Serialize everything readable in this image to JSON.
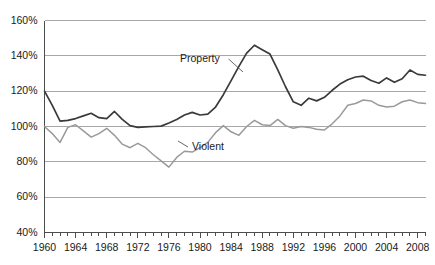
{
  "chart_data": {
    "type": "line",
    "title": "",
    "subtitle": "",
    "xlabel": "",
    "ylabel": "",
    "grid": "horizontal",
    "legend_position": "inline-annotation",
    "xlim": [
      1960,
      2009
    ],
    "ylim": [
      40,
      160
    ],
    "y_tick_labels": [
      "160%",
      "140%",
      "120%",
      "100%",
      "80%",
      "60%",
      "40%"
    ],
    "y_tick_values": [
      160,
      140,
      120,
      100,
      80,
      60,
      40
    ],
    "x_tick_labels": [
      "1960",
      "1964",
      "1968",
      "1972",
      "1976",
      "1980",
      "1984",
      "1988",
      "1992",
      "1996",
      "2000",
      "2004",
      "2008"
    ],
    "x_tick_values": [
      1960,
      1964,
      1968,
      1972,
      1976,
      1980,
      1984,
      1988,
      1992,
      1996,
      2000,
      2004,
      2008
    ],
    "x_minor_tick_step": 1,
    "x": [
      1960,
      1961,
      1962,
      1963,
      1964,
      1965,
      1966,
      1967,
      1968,
      1969,
      1970,
      1971,
      1972,
      1973,
      1974,
      1975,
      1976,
      1977,
      1978,
      1979,
      1980,
      1981,
      1982,
      1983,
      1984,
      1985,
      1986,
      1987,
      1988,
      1989,
      1990,
      1991,
      1992,
      1993,
      1994,
      1995,
      1996,
      1997,
      1998,
      1999,
      2000,
      2001,
      2002,
      2003,
      2004,
      2005,
      2006,
      2007,
      2008,
      2009
    ],
    "series": [
      {
        "name": "Property",
        "color": "#3a3a3a",
        "width": 1.7,
        "label_text": "Property",
        "values": [
          120.0,
          112.0,
          103.0,
          103.5,
          104.5,
          106.0,
          107.5,
          105.0,
          104.5,
          108.5,
          104.0,
          100.5,
          99.5,
          99.8,
          100.0,
          100.2,
          102.0,
          104.0,
          106.5,
          108.0,
          106.5,
          107.0,
          111.0,
          118.0,
          126.0,
          134.0,
          141.5,
          146.0,
          143.5,
          141.0,
          132.0,
          122.5,
          114.0,
          112.0,
          116.0,
          114.5,
          116.5,
          120.5,
          124.0,
          126.5,
          128.0,
          128.5,
          126.0,
          124.5,
          127.5,
          125.0,
          127.0,
          132.0,
          129.5,
          129.0
        ]
      },
      {
        "name": "Violent",
        "color": "#9a9a9a",
        "width": 1.5,
        "label_text": "Violent",
        "values": [
          100.0,
          96.0,
          91.0,
          99.5,
          101.0,
          97.5,
          94.0,
          96.0,
          99.0,
          95.0,
          90.0,
          88.0,
          90.5,
          88.0,
          84.0,
          80.5,
          77.0,
          82.5,
          86.0,
          85.5,
          88.0,
          91.0,
          96.5,
          100.5,
          97.0,
          95.0,
          100.0,
          103.5,
          101.0,
          100.5,
          104.0,
          100.5,
          99.0,
          100.0,
          99.5,
          98.5,
          98.0,
          101.5,
          106.0,
          112.0,
          113.0,
          115.0,
          114.5,
          112.0,
          111.0,
          111.5,
          114.0,
          115.0,
          113.5,
          113.0
        ]
      }
    ],
    "annotations": [
      {
        "name": "property-label",
        "text": "Property",
        "x_px": 180,
        "y_px": 62,
        "leader_to_x_px": 243,
        "leader_to_y_px": 72
      },
      {
        "name": "violent-label",
        "text": "Violent",
        "x_px": 192,
        "y_px": 150,
        "leader_to_x_px": 178,
        "leader_to_y_px": 141
      }
    ]
  },
  "axis": {
    "y_labels": [
      "160%",
      "140%",
      "120%",
      "100%",
      "80%",
      "60%",
      "40%"
    ],
    "x_labels": [
      "1960",
      "1964",
      "1968",
      "1972",
      "1976",
      "1980",
      "1984",
      "1988",
      "1992",
      "1996",
      "2000",
      "2004",
      "2008"
    ]
  },
  "colors": {
    "property_line": "#3a3a3a",
    "violent_line": "#9a9a9a",
    "gridline": "#a8a8a8",
    "axis": "#4d4d4d",
    "text": "#1a1a1a",
    "background": "#ffffff"
  }
}
